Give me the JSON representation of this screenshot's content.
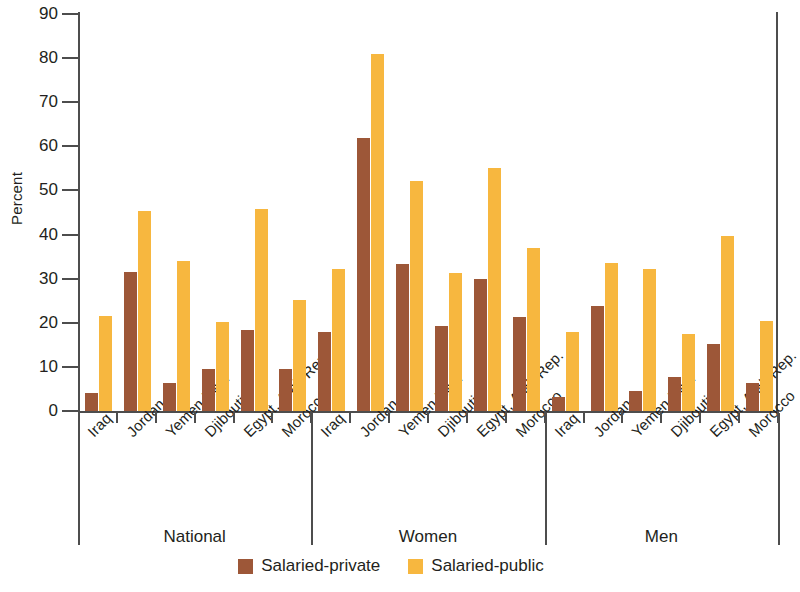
{
  "chart_data": {
    "type": "bar",
    "title": "",
    "xlabel": "",
    "ylabel": "Percent",
    "ylim": [
      0,
      90
    ],
    "yticks": [
      0,
      10,
      20,
      30,
      40,
      50,
      60,
      70,
      80,
      90
    ],
    "grid": false,
    "legend_position": "bottom-center",
    "categories": [
      "Iraq",
      "Jordan",
      "Yemen Rep.",
      "Djibouti",
      "Egypt, Arab Rep.",
      "Morocco"
    ],
    "groups": [
      "National",
      "Women",
      "Men"
    ],
    "series": [
      {
        "name": "Salaried-private",
        "color": "#9d5738"
      },
      {
        "name": "Salaried-public",
        "color": "#f7b73f"
      }
    ],
    "panels": [
      {
        "group": "National",
        "categories": [
          "Iraq",
          "Jordan",
          "Yemen Rep.",
          "Djibouti",
          "Egypt, Arab Rep.",
          "Morocco"
        ],
        "series": [
          {
            "name": "Salaried-private",
            "values": [
              4.0,
              31.4,
              6.3,
              9.5,
              18.4,
              9.6
            ]
          },
          {
            "name": "Salaried-public",
            "values": [
              21.6,
              45.3,
              33.9,
              20.2,
              45.9,
              25.1
            ]
          }
        ]
      },
      {
        "group": "Women",
        "categories": [
          "Iraq",
          "Jordan",
          "Yemen Rep.",
          "Djibouti",
          "Egypt, Arab Rep.",
          "Morocco"
        ],
        "series": [
          {
            "name": "Salaried-private",
            "values": [
              17.9,
              62.0,
              33.3,
              19.2,
              30.0,
              21.4
            ]
          },
          {
            "name": "Salaried-public",
            "values": [
              32.3,
              81.0,
              52.2,
              31.2,
              55.0,
              36.9
            ]
          }
        ]
      },
      {
        "group": "Men",
        "categories": [
          "Iraq",
          "Jordan",
          "Yemen Rep.",
          "Djibouti",
          "Egypt, Arab Rep.",
          "Morocco"
        ],
        "series": [
          {
            "name": "Salaried-private",
            "values": [
              3.1,
              23.7,
              4.6,
              7.7,
              15.3,
              6.4
            ]
          },
          {
            "name": "Salaried-public",
            "values": [
              17.9,
              33.5,
              32.3,
              17.4,
              39.6,
              20.4
            ]
          }
        ]
      }
    ]
  },
  "axis": {
    "y_label": "Percent",
    "y_tick_labels": [
      "90",
      "80",
      "70",
      "60",
      "50",
      "40",
      "30",
      "20",
      "10",
      "0"
    ]
  },
  "legend": {
    "items": [
      {
        "label": "Salaried-private",
        "color": "#9d5738"
      },
      {
        "label": "Salaried-public",
        "color": "#f7b73f"
      }
    ]
  },
  "group_labels": [
    "National",
    "Women",
    "Men"
  ],
  "colors": {
    "private": "#9d5738",
    "public": "#f7b73f",
    "axis": "#4d4d4d",
    "text": "#231f20",
    "background": "#ffffff"
  }
}
